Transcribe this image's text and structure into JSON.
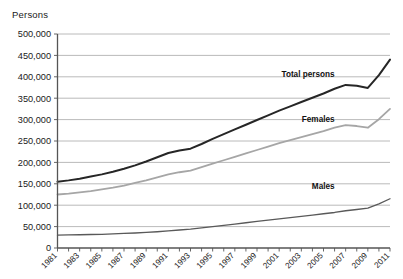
{
  "chart_data": {
    "type": "line",
    "title": "",
    "ylabel": "Persons",
    "xlabel": "",
    "ylim": [
      0,
      500000
    ],
    "ytick_step": 50000,
    "ytick_labels": [
      "0",
      "50,000",
      "100,000",
      "150,000",
      "200,000",
      "250,000",
      "300,000",
      "350,000",
      "400,000",
      "450,000",
      "500,000"
    ],
    "ytick_values": [
      0,
      50000,
      100000,
      150000,
      200000,
      250000,
      300000,
      350000,
      400000,
      450000,
      500000
    ],
    "grid": true,
    "legend_position": "inline-right",
    "xlim": [
      1981,
      2011
    ],
    "x": [
      1981,
      1982,
      1983,
      1984,
      1985,
      1986,
      1987,
      1988,
      1989,
      1990,
      1991,
      1992,
      1993,
      1994,
      1995,
      1996,
      1997,
      1998,
      1999,
      2000,
      2001,
      2002,
      2003,
      2004,
      2005,
      2006,
      2007,
      2008,
      2009,
      2010,
      2011
    ],
    "xtick_labels": [
      "1981",
      "1983",
      "1985",
      "1987",
      "1989",
      "1991",
      "1993",
      "1995",
      "1997",
      "1999",
      "2001",
      "2003",
      "2005",
      "2007",
      "2009",
      "2011"
    ],
    "xtick_label_values": [
      1981,
      1983,
      1985,
      1987,
      1989,
      1991,
      1993,
      1995,
      1997,
      1999,
      2001,
      2003,
      2005,
      2007,
      2009,
      2011
    ],
    "series": [
      {
        "name": "Total persons",
        "color": "#262626",
        "width": 2.0,
        "label_x": 2006,
        "label_y": 400000,
        "values": [
          155000,
          158000,
          162000,
          167000,
          172000,
          178000,
          185000,
          193000,
          202000,
          212000,
          222000,
          228000,
          232000,
          243000,
          255000,
          266000,
          277000,
          288000,
          299000,
          310000,
          321000,
          331000,
          341000,
          351000,
          361000,
          372000,
          381000,
          379000,
          374000,
          404000,
          440000
        ]
      },
      {
        "name": "Females",
        "color": "#a6a6a6",
        "width": 1.8,
        "label_x": 2006,
        "label_y": 295000,
        "values": [
          125000,
          127000,
          130000,
          133000,
          137000,
          141000,
          146000,
          152000,
          158000,
          165000,
          172000,
          177000,
          181000,
          189000,
          197000,
          205000,
          213000,
          221000,
          229000,
          237000,
          245000,
          252000,
          259000,
          266000,
          273000,
          281000,
          287000,
          285000,
          281000,
          301000,
          325000
        ]
      },
      {
        "name": "Males",
        "color": "#595959",
        "width": 1.3,
        "label_x": 2006,
        "label_y": 138000,
        "values": [
          30000,
          30500,
          31000,
          31500,
          32000,
          33000,
          34000,
          35000,
          36500,
          38000,
          40000,
          42000,
          44000,
          47000,
          50000,
          53000,
          56000,
          59000,
          62000,
          65000,
          68000,
          71000,
          74000,
          77000,
          80000,
          83000,
          87000,
          90000,
          93000,
          103000,
          115000
        ]
      }
    ]
  }
}
